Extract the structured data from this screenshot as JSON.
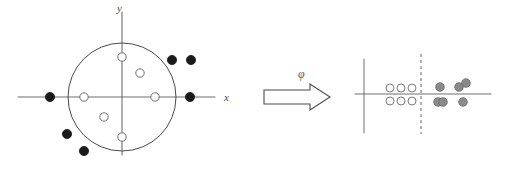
{
  "figure": {
    "title": "",
    "panels": [
      {
        "id": "input-space",
        "axes": {
          "x_label": "x",
          "y_label": "y",
          "x_axis": {
            "x1": 18,
            "y1": 97,
            "x2": 215,
            "y2": 97
          },
          "y_axis": {
            "x1": 122,
            "y1": 12,
            "x2": 122,
            "y2": 155
          },
          "x_label_pos": {
            "x": 224,
            "y": 101
          },
          "y_label_pos": {
            "x": 117,
            "y": 12
          }
        },
        "boundary": {
          "type": "circle",
          "cx": 122,
          "cy": 97,
          "r": 54
        },
        "class_inner": {
          "name": "inner-class",
          "marker": "open-circle",
          "fill": "#ffffff",
          "stroke": "#6e6e6e",
          "radius": 4.2,
          "points": [
            {
              "cx": 122,
              "cy": 57
            },
            {
              "cx": 140,
              "cy": 73
            },
            {
              "cx": 84,
              "cy": 97
            },
            {
              "cx": 155,
              "cy": 97
            },
            {
              "cx": 104,
              "cy": 117
            },
            {
              "cx": 122,
              "cy": 137
            }
          ]
        },
        "class_outer": {
          "name": "outer-class",
          "marker": "filled-circle",
          "fill": "#1a1a1a",
          "stroke": "#1a1a1a",
          "radius": 4.6,
          "points": [
            {
              "cx": 172,
              "cy": 60
            },
            {
              "cx": 191,
              "cy": 60
            },
            {
              "cx": 50,
              "cy": 97
            },
            {
              "cx": 190,
              "cy": 97
            },
            {
              "cx": 67,
              "cy": 134
            },
            {
              "cx": 84,
              "cy": 151
            }
          ]
        }
      },
      {
        "id": "feature-space",
        "axes": {
          "x_label": "",
          "y_label": "",
          "x_axis": {
            "x1": 355,
            "y1": 94,
            "x2": 491,
            "y2": 94
          },
          "y_axis": {
            "x1": 364,
            "y1": 59,
            "x2": 364,
            "y2": 133
          }
        },
        "separator": {
          "type": "dashed-vertical",
          "x": 421,
          "y1": 54,
          "y2": 134,
          "stroke": "#808080",
          "dash": "3,3"
        },
        "class_inner": {
          "name": "inner-class",
          "marker": "open-circle",
          "fill": "#ffffff",
          "stroke": "#7a7a7a",
          "radius": 4.0,
          "points": [
            {
              "cx": 390,
              "cy": 88
            },
            {
              "cx": 401,
              "cy": 88
            },
            {
              "cx": 412,
              "cy": 88
            },
            {
              "cx": 390,
              "cy": 101
            },
            {
              "cx": 401,
              "cy": 101
            },
            {
              "cx": 412,
              "cy": 101
            }
          ]
        },
        "class_outer": {
          "name": "outer-class",
          "marker": "filled-gray-circle",
          "fill": "#8a8a8a",
          "stroke": "#6a6a6a",
          "radius": 4.3,
          "points": [
            {
              "cx": 440,
              "cy": 87
            },
            {
              "cx": 459,
              "cy": 87
            },
            {
              "cx": 466,
              "cy": 83
            },
            {
              "cx": 438,
              "cy": 102
            },
            {
              "cx": 443,
              "cy": 102
            },
            {
              "cx": 463,
              "cy": 102
            }
          ]
        }
      }
    ],
    "mapping_arrow": {
      "label": "φ",
      "label_pos": {
        "x": 298,
        "y": 78
      },
      "fill": "#ffffff",
      "stroke": "#4a4a4a",
      "path": "M 264 90 L 310 90 L 310 84 L 330 97 L 310 110 L 310 104 L 264 104 Z"
    },
    "colors": {
      "axis": "#6e6e6e",
      "boundary": "#4a4a4a",
      "filled_marker": "#1a1a1a",
      "gray_marker": "#8a8a8a",
      "open_marker_stroke": "#6e6e6e",
      "dashed_separator": "#808080",
      "arrow_stroke": "#4a4a4a",
      "background": "#ffffff"
    }
  }
}
